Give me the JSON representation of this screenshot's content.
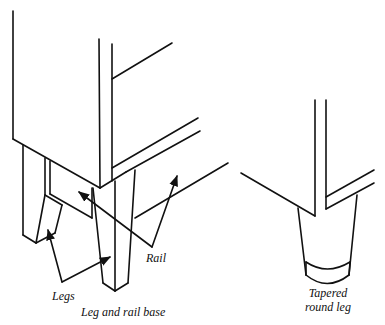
{
  "figure": {
    "left_panel": {
      "caption": "Leg and rail base",
      "labels": {
        "legs": "Legs",
        "rail": "Rail"
      }
    },
    "right_panel": {
      "caption_line1": "Tapered",
      "caption_line2": "round leg"
    },
    "colors": {
      "ink": "#111111",
      "background": "#ffffff"
    }
  }
}
